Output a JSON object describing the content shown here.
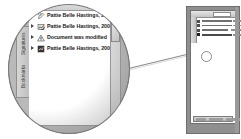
{
  "figure": {
    "kind": "magnified-callout-screenshot",
    "background_color": "#ffffff",
    "callout": {
      "lens_fill": "#b9b9b9",
      "lens_border": "#8e8e8e",
      "leader_line_color": "#8c8c8c",
      "hotspot_label": "magnified-region"
    }
  },
  "panel": {
    "name": "Signatures navigation panel",
    "column_header": "Signatures",
    "sort_indicator": "sort-descending-arrow",
    "vertical_tabs": [
      {
        "label": "Signatures"
      },
      {
        "label": "Bookmarks"
      }
    ],
    "rows": [
      {
        "twisty": "collapsed",
        "icon": "signature-pen-icon",
        "text": "Pattie Belle Hastings, 2001.0"
      },
      {
        "twisty": "collapsed",
        "icon": "signature-valid-icon",
        "text": "Pattie Belle Hastings, 2001.1"
      },
      {
        "twisty": "collapsed",
        "icon": "warning-triangle-icon",
        "text": "Document was modified"
      },
      {
        "twisty": "collapsed",
        "icon": "signature-stamp-icon",
        "text": "Pattie Belle Hastings, 2001.1"
      }
    ],
    "scrollbar": {
      "up_arrow": "scroll-up-arrow",
      "down_arrow": "scroll-down-arrow",
      "thumb": "scroll-thumb"
    }
  },
  "mini_window": {
    "name": "Acrobat document window (reduced)",
    "chrome_color": "#8f8f8f",
    "toolbar": "toolbar",
    "list_rows": [
      {
        "icon": "row-marker",
        "bar_width": 30,
        "bar2_left": 36,
        "bar2_width": 8
      },
      {
        "icon": "row-marker",
        "bar_width": 30,
        "bar2_left": 36,
        "bar2_width": 8
      },
      {
        "icon": "row-marker",
        "bar_width": 26,
        "bar2_left": 34,
        "bar2_width": 10
      },
      {
        "icon": "row-marker",
        "bar_width": 30,
        "bar2_left": 36,
        "bar2_width": 8
      }
    ],
    "status_segments": [
      {
        "left": 2,
        "width": 10
      },
      {
        "left": 15,
        "width": 14
      },
      {
        "left": 32,
        "width": 14
      }
    ]
  }
}
